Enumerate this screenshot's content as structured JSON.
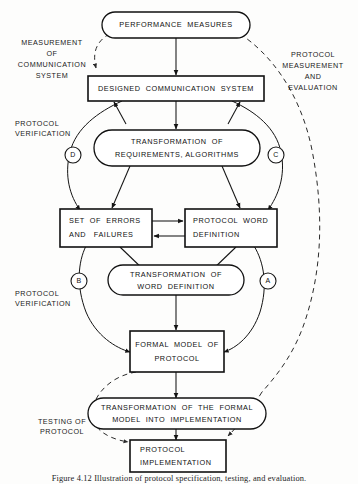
{
  "figure": {
    "caption": "Figure 4.12 Illustration of protocol specification, testing, and evaluation.",
    "background_color": "#fdfdfc",
    "line_color": "#141414"
  },
  "nodes": [
    {
      "id": "performance-measures",
      "shape": "stadium",
      "lines": [
        "PERFORMANCE  MEASURES"
      ]
    },
    {
      "id": "designed-communication-system",
      "shape": "rect",
      "lines": [
        "DESIGNED  COMMUNICATION  SYSTEM"
      ]
    },
    {
      "id": "transformation-requirements",
      "shape": "stadium",
      "lines": [
        "TRANSFORMATION  OF",
        "REQUIREMENTS, ALGORITHMS"
      ]
    },
    {
      "id": "set-of-errors",
      "shape": "rect",
      "lines": [
        "SET  OF  ERRORS",
        "AND   FAILURES"
      ]
    },
    {
      "id": "protocol-word-definition",
      "shape": "rect",
      "lines": [
        "PROTOCOL  WORD",
        "DEFINITION"
      ]
    },
    {
      "id": "transformation-word-definition",
      "shape": "stadium",
      "lines": [
        "TRANSFORMATION  OF",
        "WORD  DEFINITION"
      ]
    },
    {
      "id": "formal-model-of-protocol",
      "shape": "rect",
      "lines": [
        "FORMAL  MODEL  OF",
        "PROTOCOL"
      ]
    },
    {
      "id": "transformation-into-implementation",
      "shape": "stadium",
      "lines": [
        "TRANSFORMATION  OF  THE  FORMAL",
        "MODEL  INTO  IMPLEMENTATION"
      ]
    },
    {
      "id": "protocol-implementation",
      "shape": "rect",
      "lines": [
        "PROTOCOL",
        "IMPLEMENTATION"
      ]
    }
  ],
  "markers": [
    {
      "id": "marker-a",
      "label": "A"
    },
    {
      "id": "marker-b",
      "label": "B"
    },
    {
      "id": "marker-c",
      "label": "C"
    },
    {
      "id": "marker-d",
      "label": "D"
    }
  ],
  "annotations": [
    {
      "id": "measurement-of-communication-system",
      "lines": [
        "MEASUREMENT",
        "OF",
        "COMMUNICATION",
        "SYSTEM"
      ]
    },
    {
      "id": "protocol-measurement-and-evaluation",
      "lines": [
        "PROTOCOL",
        "MEASUREMENT",
        "AND",
        "EVALUATION"
      ]
    },
    {
      "id": "protocol-verification-upper",
      "lines": [
        "PROTOCOL",
        "VERIFICATION"
      ]
    },
    {
      "id": "protocol-verification-lower",
      "lines": [
        "PROTOCOL",
        "VERIFICATION"
      ]
    },
    {
      "id": "testing-of-protocol",
      "lines": [
        "TESTING  OF",
        "PROTOCOL"
      ]
    }
  ]
}
